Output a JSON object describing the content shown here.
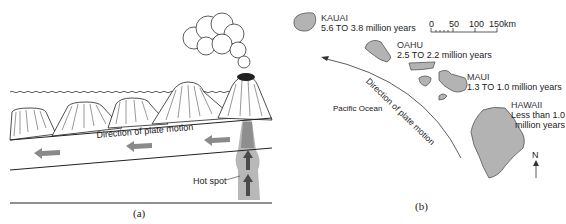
{
  "panel_a": {
    "caption": "(a)",
    "plate_motion_label": "Direction of plate motion",
    "hot_spot_label": "Hot spot",
    "colors": {
      "arrow": "#8a8a8a",
      "plume": "#b8b8b8",
      "plume_dark": "#6e6e6e",
      "line": "#222222"
    }
  },
  "panel_b": {
    "caption": "(b)",
    "ocean_label": "Pacific Ocean",
    "plate_motion_label": "Direction of plate motion",
    "north_label": "N",
    "scale": {
      "ticks": [
        "0",
        "50",
        "100",
        "150km"
      ]
    },
    "islands": [
      {
        "name": "KAUAI",
        "age": "5.6 TO 3.8 million years"
      },
      {
        "name": "OAHU",
        "age": "2.5 TO 2.2 million years"
      },
      {
        "name": "MAUI",
        "age": "1.3 TO 1.0 million years"
      },
      {
        "name": "HAWAII",
        "age_line1": "Less than 1.0",
        "age_line2": "million years"
      }
    ],
    "colors": {
      "island_fill": "#b3b3b3",
      "island_stroke": "#555555"
    }
  }
}
